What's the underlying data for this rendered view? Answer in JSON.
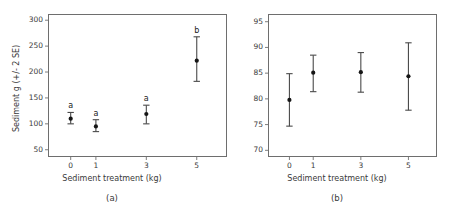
{
  "figure": {
    "width": 449,
    "height": 212,
    "background": "#ffffff",
    "ink_color": "#2b2b2b",
    "frame_color": "#6e6e6e"
  },
  "chart_data": [
    {
      "type": "scatter",
      "panel_id": "a",
      "caption": "(a)",
      "title": "",
      "xlabel": "Sediment treatment (kg)",
      "ylabel": "Sediment g (+/- 2 SE)",
      "error_bars": "2 SE",
      "grid": false,
      "legend": "none",
      "x": [
        0,
        1,
        3,
        5
      ],
      "xtick_labels": [
        "0",
        "1",
        "3",
        "5"
      ],
      "xlim": [
        -0.9,
        6.2
      ],
      "ylim": [
        36,
        312
      ],
      "ytick_values": [
        50,
        100,
        150,
        200,
        250,
        300
      ],
      "ytick_labels": [
        "50",
        "100",
        "150",
        "200",
        "250",
        "300"
      ],
      "values": [
        110,
        95,
        119,
        222
      ],
      "err_low": [
        100,
        85,
        100,
        182
      ],
      "err_high": [
        122,
        108,
        136,
        268
      ],
      "group_letters": [
        "a",
        "a",
        "a",
        "b"
      ]
    },
    {
      "type": "scatter",
      "panel_id": "b",
      "caption": "(b)",
      "title": "",
      "xlabel": "Sediment treatment (kg)",
      "ylabel": "",
      "error_bars": "2 SE",
      "grid": false,
      "legend": "none",
      "x": [
        0,
        1,
        3,
        5
      ],
      "xtick_labels": [
        "0",
        "1",
        "3",
        "5"
      ],
      "xlim": [
        -0.9,
        6.2
      ],
      "ylim": [
        68.7,
        96.5
      ],
      "ytick_values": [
        70,
        75,
        80,
        85,
        90,
        95
      ],
      "ytick_labels": [
        "70",
        "75",
        "80",
        "85",
        "90",
        "95"
      ],
      "values": [
        79.8,
        85.1,
        85.2,
        84.4
      ],
      "err_low": [
        74.7,
        81.4,
        81.3,
        77.8
      ],
      "err_high": [
        84.9,
        88.5,
        89.0,
        90.9
      ],
      "group_letters": [
        "",
        "",
        "",
        ""
      ]
    }
  ]
}
